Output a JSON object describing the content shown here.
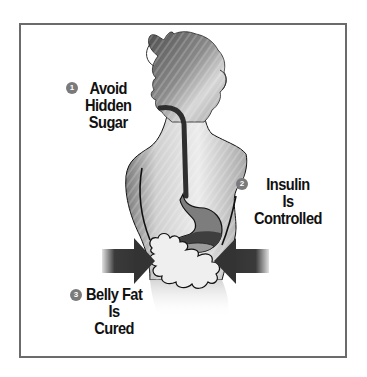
{
  "figure": {
    "type": "infographic",
    "colors": {
      "border": "#6b6b6b",
      "background": "#ffffff",
      "silhouette_dark": "#5a5a5a",
      "silhouette_light": "#e6e6e6",
      "esophagus": "#3a3a3a",
      "stomach_upper": "#7d7d7d",
      "stomach_lower": "#3e3e3e",
      "arrow": "#3a3a3a",
      "label_text": "#111111",
      "badge": "#7a7a7a"
    }
  },
  "steps": [
    {
      "number": "1",
      "lines": [
        "Avoid",
        "Hidden",
        "Sugar"
      ]
    },
    {
      "number": "2",
      "lines": [
        "Insulin",
        "Is",
        "Controlled"
      ]
    },
    {
      "number": "3",
      "lines": [
        "Belly Fat",
        "Is",
        "Cured"
      ]
    }
  ],
  "icons": {
    "left_arrow": "arrow-right-icon",
    "right_arrow": "arrow-left-icon",
    "belly_fat": "fat-cloud-icon"
  }
}
